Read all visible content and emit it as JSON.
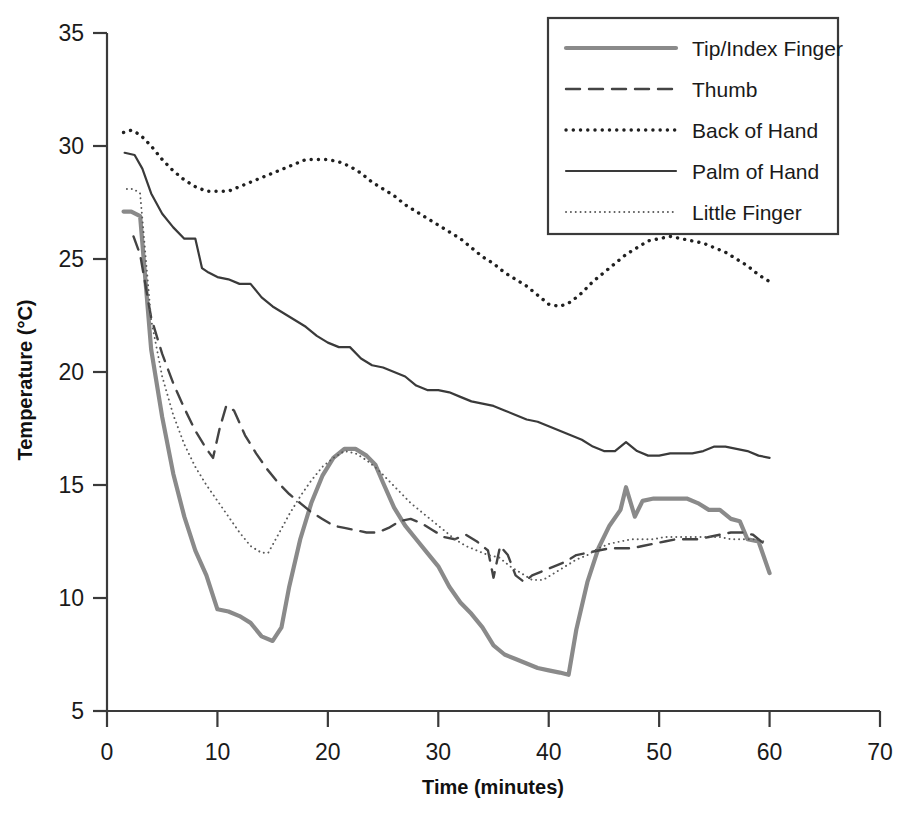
{
  "chart_data": {
    "type": "line",
    "title": "",
    "xlabel": "Time (minutes)",
    "ylabel": "Temperature (°C)",
    "xlim": [
      0,
      70
    ],
    "ylim": [
      5,
      35
    ],
    "xticks": [
      0,
      10,
      20,
      30,
      40,
      50,
      60,
      70
    ],
    "yticks": [
      5,
      10,
      15,
      20,
      25,
      30,
      35
    ],
    "xtick_labels": [
      "0",
      "10",
      "20",
      "30",
      "40",
      "50",
      "60",
      "70"
    ],
    "ytick_labels": [
      "5",
      "10",
      "15",
      "20",
      "25",
      "30",
      "35"
    ],
    "grid": false,
    "legend_position": "top-right",
    "series": [
      {
        "name": "Tip/Index Finger",
        "style": "solid-thick",
        "color": "#8a8a8a",
        "width": 4.2,
        "x": [
          1.5,
          2.2,
          3.0,
          4.0,
          5.0,
          6.0,
          7.0,
          8.0,
          9.0,
          10.0,
          11.0,
          12.0,
          13.0,
          14.0,
          15.0,
          15.8,
          16.5,
          17.5,
          18.5,
          19.5,
          20.5,
          21.5,
          22.5,
          23.5,
          24.3,
          25.0,
          26.0,
          27.0,
          28.0,
          29.0,
          30.0,
          31.0,
          32.0,
          33.0,
          34.0,
          35.0,
          36.0,
          37.0,
          38.0,
          39.0,
          40.0,
          41.0,
          41.8,
          42.5,
          43.5,
          44.5,
          45.5,
          46.5,
          47.0,
          47.8,
          48.5,
          49.5,
          50.5,
          51.5,
          52.5,
          53.5,
          54.5,
          55.5,
          56.5,
          57.3,
          58.0,
          59.0,
          60.0
        ],
        "y": [
          27.1,
          27.1,
          26.9,
          21.0,
          18.0,
          15.5,
          13.6,
          12.1,
          11.0,
          9.5,
          9.4,
          9.2,
          8.9,
          8.3,
          8.1,
          8.7,
          10.5,
          12.6,
          14.2,
          15.4,
          16.2,
          16.6,
          16.6,
          16.3,
          15.9,
          15.1,
          14.0,
          13.2,
          12.6,
          12.0,
          11.4,
          10.5,
          9.8,
          9.3,
          8.7,
          7.9,
          7.5,
          7.3,
          7.1,
          6.9,
          6.8,
          6.7,
          6.6,
          8.6,
          10.7,
          12.2,
          13.2,
          13.9,
          14.9,
          13.6,
          14.3,
          14.4,
          14.4,
          14.4,
          14.4,
          14.2,
          13.9,
          13.9,
          13.5,
          13.4,
          12.6,
          12.5,
          11.1
        ]
      },
      {
        "name": "Thumb",
        "style": "dashed",
        "color": "#444444",
        "width": 2.4,
        "x": [
          2.4,
          3.0,
          4.0,
          5.0,
          6.0,
          7.0,
          8.0,
          9.0,
          9.6,
          10.2,
          10.8,
          11.5,
          12.5,
          13.5,
          14.5,
          15.5,
          16.5,
          17.5,
          18.5,
          19.5,
          20.5,
          21.5,
          22.5,
          23.5,
          24.5,
          25.5,
          26.5,
          27.5,
          28.5,
          29.5,
          30.5,
          31.5,
          32.5,
          33.5,
          34.5,
          35.0,
          35.6,
          36.3,
          37.0,
          37.8,
          38.5,
          39.5,
          40.5,
          41.5,
          42.5,
          43.5,
          44.5,
          45.5,
          46.5,
          47.5,
          48.5,
          49.5,
          50.5,
          51.5,
          52.5,
          53.5,
          54.5,
          55.5,
          56.5,
          57.5,
          58.5,
          59.5,
          60.0
        ],
        "y": [
          26.0,
          25.2,
          22.4,
          20.8,
          19.5,
          18.4,
          17.4,
          16.6,
          16.2,
          17.5,
          18.5,
          18.3,
          17.2,
          16.4,
          15.7,
          15.1,
          14.6,
          14.2,
          13.8,
          13.5,
          13.2,
          13.1,
          13.0,
          12.9,
          12.9,
          13.1,
          13.4,
          13.5,
          13.3,
          13.0,
          12.7,
          12.6,
          12.8,
          12.5,
          12.1,
          10.9,
          12.3,
          11.9,
          11.0,
          10.7,
          11.0,
          11.2,
          11.4,
          11.6,
          11.9,
          12.0,
          12.1,
          12.2,
          12.2,
          12.2,
          12.3,
          12.4,
          12.5,
          12.6,
          12.6,
          12.6,
          12.7,
          12.8,
          12.9,
          12.9,
          12.8,
          12.4,
          12.3
        ]
      },
      {
        "name": "Back of Hand",
        "style": "dotted-bold",
        "color": "#202020",
        "width": 3.4,
        "x": [
          1.5,
          2.2,
          3.0,
          4.0,
          5.0,
          6.0,
          7.0,
          8.0,
          9.0,
          10.0,
          11.0,
          12.0,
          13.0,
          14.0,
          15.0,
          16.0,
          17.0,
          18.0,
          19.0,
          20.0,
          21.0,
          22.0,
          23.0,
          24.0,
          25.0,
          26.0,
          27.0,
          28.0,
          29.0,
          30.0,
          31.0,
          32.0,
          33.0,
          34.0,
          35.0,
          36.0,
          37.0,
          38.0,
          39.0,
          40.0,
          41.0,
          42.0,
          43.0,
          44.0,
          45.0,
          46.0,
          47.0,
          48.0,
          49.0,
          50.0,
          51.0,
          52.0,
          53.0,
          54.0,
          55.0,
          56.0,
          57.0,
          58.0,
          59.0,
          60.0
        ],
        "y": [
          30.6,
          30.7,
          30.5,
          30.0,
          29.4,
          28.9,
          28.5,
          28.2,
          28.0,
          28.0,
          28.0,
          28.2,
          28.4,
          28.6,
          28.8,
          29.0,
          29.2,
          29.4,
          29.4,
          29.4,
          29.3,
          29.1,
          28.8,
          28.4,
          28.1,
          27.8,
          27.4,
          27.1,
          26.8,
          26.5,
          26.2,
          25.9,
          25.5,
          25.1,
          24.8,
          24.4,
          24.1,
          23.8,
          23.4,
          23.0,
          22.9,
          23.1,
          23.5,
          24.0,
          24.4,
          24.8,
          25.2,
          25.5,
          25.8,
          25.9,
          26.0,
          25.9,
          25.8,
          25.7,
          25.5,
          25.3,
          25.0,
          24.7,
          24.3,
          24.0
        ]
      },
      {
        "name": "Palm of Hand",
        "style": "solid-thin",
        "color": "#3a3a3a",
        "width": 2.2,
        "x": [
          1.6,
          2.5,
          3.2,
          4.0,
          5.0,
          6.0,
          7.0,
          8.0,
          8.6,
          9.2,
          10.0,
          11.0,
          12.0,
          13.0,
          14.0,
          15.0,
          16.0,
          17.0,
          18.0,
          19.0,
          20.0,
          21.0,
          22.0,
          23.0,
          24.0,
          25.0,
          26.0,
          27.0,
          28.0,
          29.0,
          30.0,
          31.0,
          32.0,
          33.0,
          34.0,
          35.0,
          36.0,
          37.0,
          38.0,
          39.0,
          40.0,
          41.0,
          42.0,
          43.0,
          44.0,
          45.0,
          46.0,
          47.0,
          48.0,
          49.0,
          50.0,
          51.0,
          52.0,
          53.0,
          54.0,
          55.0,
          56.0,
          57.0,
          58.0,
          59.0,
          60.0
        ],
        "y": [
          29.7,
          29.6,
          29.0,
          27.9,
          27.0,
          26.4,
          25.9,
          25.9,
          24.6,
          24.4,
          24.2,
          24.1,
          23.9,
          23.9,
          23.3,
          22.9,
          22.6,
          22.3,
          22.0,
          21.6,
          21.3,
          21.1,
          21.1,
          20.6,
          20.3,
          20.2,
          20.0,
          19.8,
          19.4,
          19.2,
          19.2,
          19.1,
          18.9,
          18.7,
          18.6,
          18.5,
          18.3,
          18.1,
          17.9,
          17.8,
          17.6,
          17.4,
          17.2,
          17.0,
          16.7,
          16.5,
          16.5,
          16.9,
          16.5,
          16.3,
          16.3,
          16.4,
          16.4,
          16.4,
          16.5,
          16.7,
          16.7,
          16.6,
          16.5,
          16.3,
          16.2
        ]
      },
      {
        "name": "Little Finger",
        "style": "dotted-fine",
        "color": "#5a5a5a",
        "width": 1.9,
        "x": [
          1.8,
          2.4,
          3.0,
          4.0,
          5.0,
          6.0,
          7.0,
          8.0,
          9.0,
          10.0,
          11.0,
          12.0,
          13.0,
          14.0,
          14.6,
          15.5,
          16.5,
          17.5,
          18.5,
          19.5,
          20.5,
          21.5,
          22.5,
          23.5,
          24.5,
          25.5,
          26.5,
          27.5,
          28.5,
          29.5,
          30.5,
          31.5,
          32.5,
          33.5,
          34.5,
          35.5,
          36.5,
          37.5,
          38.5,
          39.5,
          40.5,
          41.5,
          42.5,
          43.5,
          44.5,
          45.5,
          46.5,
          47.5,
          48.5,
          49.5,
          50.5,
          51.5,
          52.5,
          53.5,
          54.5,
          55.5,
          56.5,
          57.5,
          58.5,
          59.5
        ],
        "y": [
          28.1,
          28.1,
          27.9,
          22.3,
          19.8,
          18.1,
          16.8,
          15.8,
          15.0,
          14.3,
          13.6,
          12.9,
          12.3,
          12.0,
          12.0,
          12.8,
          13.7,
          14.5,
          15.2,
          15.8,
          16.2,
          16.5,
          16.4,
          16.1,
          15.7,
          15.2,
          14.7,
          14.2,
          13.8,
          13.4,
          13.0,
          12.6,
          12.3,
          12.1,
          11.9,
          11.8,
          11.4,
          11.1,
          10.8,
          10.8,
          11.1,
          11.4,
          11.7,
          11.9,
          12.2,
          12.4,
          12.5,
          12.6,
          12.6,
          12.6,
          12.7,
          12.7,
          12.7,
          12.7,
          12.7,
          12.7,
          12.6,
          12.6,
          12.6,
          12.5
        ]
      }
    ],
    "legend": [
      {
        "label": "Tip/Index Finger"
      },
      {
        "label": "Thumb"
      },
      {
        "label": "Back of Hand"
      },
      {
        "label": "Palm of Hand"
      },
      {
        "label": "Little Finger"
      }
    ]
  }
}
